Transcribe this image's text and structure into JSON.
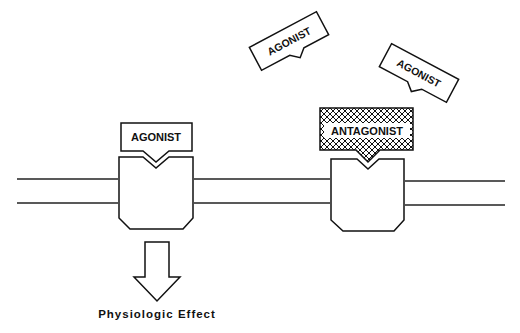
{
  "diagram": {
    "labels": {
      "agonist_bound": "AGONIST",
      "antagonist_bound": "ANTAGONIST",
      "agonist_free_1": "AGONIST",
      "agonist_free_2": "AGONIST",
      "effect": "Physiologic Effect"
    },
    "colors": {
      "stroke": "#111111",
      "background": "#ffffff"
    }
  }
}
